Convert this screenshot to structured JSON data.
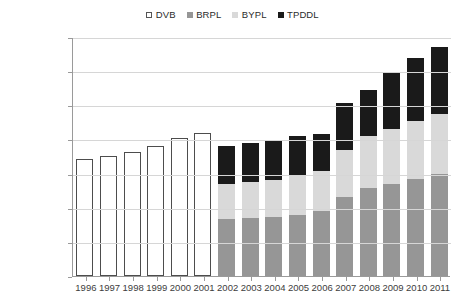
{
  "legend": {
    "position": "top-center",
    "items": [
      {
        "label": "DVB",
        "color": "#ffffff",
        "swatch": "sw-dvb"
      },
      {
        "label": "BRPL",
        "color": "#969696",
        "swatch": "sw-brpl"
      },
      {
        "label": "BYPL",
        "color": "#d9d9d9",
        "swatch": "sw-bypl"
      },
      {
        "label": "TPDDL",
        "color": "#1a1a1a",
        "swatch": "sw-tpddl"
      }
    ]
  },
  "axis": {
    "y_ticks": [
      {
        "label": "35,00,000",
        "value": 3500000
      },
      {
        "label": "30,00,000",
        "value": 3000000
      },
      {
        "label": "25,00,000",
        "value": 2500000
      },
      {
        "label": "20,00,000",
        "value": 2000000
      },
      {
        "label": "15,00,000",
        "value": 1500000
      },
      {
        "label": "10,00,000",
        "value": 1000000
      },
      {
        "label": "5,00,000",
        "value": 500000
      },
      {
        "label": "0",
        "value": 0
      }
    ]
  },
  "chart_data": {
    "type": "bar",
    "stacked": true,
    "title": "",
    "subtitle": "",
    "xlabel": "",
    "ylabel": "",
    "ylim": [
      0,
      3500000
    ],
    "ytick_step": 500000,
    "grid": true,
    "legend_position": "top-center",
    "categories": [
      "1996",
      "1997",
      "1998",
      "1999",
      "2000",
      "2001",
      "2002",
      "2003",
      "2004",
      "2005",
      "2006",
      "2007",
      "2008",
      "2009",
      "2010",
      "2011"
    ],
    "series": [
      {
        "name": "DVB",
        "color": "#ffffff",
        "values": [
          1720000,
          1760000,
          1820000,
          1910000,
          2020000,
          2090000,
          0,
          0,
          0,
          0,
          0,
          0,
          0,
          0,
          0,
          0
        ]
      },
      {
        "name": "BRPL",
        "color": "#969696",
        "values": [
          0,
          0,
          0,
          0,
          0,
          0,
          830000,
          850000,
          870000,
          900000,
          950000,
          1150000,
          1290000,
          1350000,
          1420000,
          1500000
        ]
      },
      {
        "name": "BYPL",
        "color": "#d9d9d9",
        "values": [
          0,
          0,
          0,
          0,
          0,
          0,
          520000,
          530000,
          540000,
          560000,
          590000,
          700000,
          760000,
          800000,
          850000,
          880000
        ]
      },
      {
        "name": "TPDDL",
        "color": "#1a1a1a",
        "values": [
          0,
          0,
          0,
          0,
          0,
          0,
          560000,
          570000,
          580000,
          590000,
          540000,
          690000,
          680000,
          830000,
          930000,
          970000
        ]
      }
    ],
    "totals": [
      1720000,
      1760000,
      1820000,
      1910000,
      2020000,
      2090000,
      1910000,
      1950000,
      1990000,
      2050000,
      2080000,
      2540000,
      2730000,
      2980000,
      3200000,
      3350000
    ]
  }
}
